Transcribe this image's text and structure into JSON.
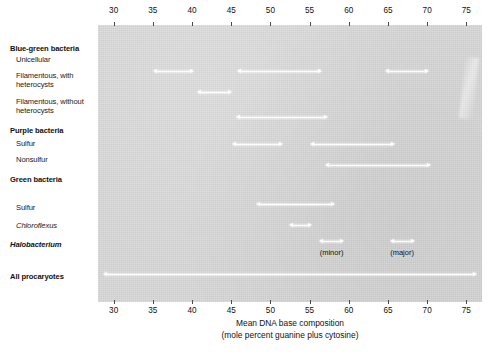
{
  "chart_data": {
    "type": "range-bar",
    "title": "",
    "xlabel": "Mean DNA base composition",
    "xlabel_sub": "(mole percent guanine plus cytosine)",
    "xlim": [
      28,
      77
    ],
    "xticks": [
      30,
      35,
      40,
      45,
      50,
      55,
      60,
      65,
      70,
      75
    ],
    "ticklabels": [
      "30",
      "35",
      "40",
      "45",
      "50",
      "55",
      "60",
      "65",
      "70",
      "75"
    ],
    "axis_position": "both",
    "grid": false,
    "legend": null,
    "background_color": "#d9d9d9",
    "arrow_color": "#ffffff",
    "categories": [
      {
        "label": "Blue-green bacteria",
        "style": "group",
        "ranges": []
      },
      {
        "label": "Unicellular",
        "style": "sub",
        "ranges": [
          [
            35.0,
            40.2
          ],
          [
            45.8,
            56.6
          ],
          [
            64.6,
            70.2
          ]
        ]
      },
      {
        "label": "Filamentous, with",
        "label2": "heterocysts",
        "style": "sub",
        "ranges": [
          [
            40.6,
            45.1
          ]
        ]
      },
      {
        "label": "Filamentous, without",
        "label2": "heterocysts",
        "style": "sub",
        "ranges": [
          [
            45.6,
            57.3
          ]
        ]
      },
      {
        "label": "Purple bacteria",
        "style": "group",
        "ranges": []
      },
      {
        "label": "Sulfur",
        "style": "sub",
        "ranges": [
          [
            45.1,
            51.6
          ],
          [
            55.0,
            65.9
          ]
        ]
      },
      {
        "label": "Nonsulfur",
        "style": "sub",
        "ranges": [
          [
            57.0,
            70.5
          ]
        ]
      },
      {
        "label": "Green bacteria",
        "style": "group",
        "ranges": []
      },
      {
        "label": "Sulfur",
        "style": "sub",
        "ranges": [
          [
            48.2,
            58.3
          ]
        ]
      },
      {
        "label": "Chloroflexus",
        "style": "italic",
        "ranges": [
          [
            52.4,
            55.3
          ]
        ]
      },
      {
        "label": "Halobacterium",
        "style": "bold-italic",
        "ranges": [
          [
            56.2,
            59.4
          ],
          [
            65.2,
            68.4
          ]
        ],
        "range_notes": [
          "(minor)",
          "(major)"
        ]
      },
      {
        "label": "All procaryotes",
        "style": "group",
        "ranges": [
          [
            28.6,
            76.4
          ]
        ]
      }
    ],
    "annotations": [
      {
        "text": "(minor)",
        "x": 57.8,
        "row": "Halobacterium"
      },
      {
        "text": "(major)",
        "x": 66.8,
        "row": "Halobacterium"
      }
    ]
  }
}
